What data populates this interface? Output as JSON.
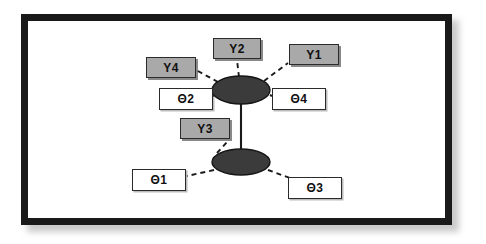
{
  "figure": {
    "type": "path-diagram",
    "frame": {
      "border_color": "#1a1a1a",
      "border_width_px": 7,
      "background": "#ffffff"
    },
    "colors": {
      "indicator_fill": "#a9a9a9",
      "error_fill": "#ffffff",
      "node_fill": "#3b3b3b",
      "stroke": "#2b2b2b",
      "line": "#1a1a1a"
    }
  },
  "latent_nodes": [
    {
      "id": "factor-top",
      "label": "",
      "cx": 241,
      "cy": 90,
      "rx": 29,
      "ry": 14
    },
    {
      "id": "factor-bottom",
      "label": "",
      "cx": 241,
      "cy": 162,
      "rx": 29,
      "ry": 13
    }
  ],
  "indicator_boxes": [
    {
      "id": "y1",
      "label": "Y1",
      "style": "gray",
      "x": 289,
      "y": 44,
      "w": 50,
      "h": 21
    },
    {
      "id": "y2",
      "label": "Y2",
      "style": "gray",
      "x": 213,
      "y": 38,
      "w": 48,
      "h": 21
    },
    {
      "id": "y3",
      "label": "Y3",
      "style": "gray",
      "x": 180,
      "y": 118,
      "w": 50,
      "h": 21
    },
    {
      "id": "y4",
      "label": "Y4",
      "style": "gray",
      "x": 146,
      "y": 57,
      "w": 50,
      "h": 21
    }
  ],
  "error_boxes": [
    {
      "id": "t1",
      "label": "Θ1",
      "style": "white",
      "x": 132,
      "y": 169,
      "w": 54,
      "h": 22
    },
    {
      "id": "t2",
      "label": "Θ2",
      "style": "white",
      "x": 159,
      "y": 88,
      "w": 54,
      "h": 22
    },
    {
      "id": "t3",
      "label": "Θ3",
      "style": "white",
      "x": 288,
      "y": 177,
      "w": 54,
      "h": 22
    },
    {
      "id": "t4",
      "label": "Θ4",
      "style": "white",
      "x": 272,
      "y": 88,
      "w": 54,
      "h": 22
    }
  ],
  "edges": [
    {
      "id": "edge-factor-link",
      "from": "factor-top",
      "to": "factor-bottom",
      "style": "solid"
    },
    {
      "id": "edge-top-y4",
      "from": "factor-top",
      "to": "y4",
      "style": "dashed"
    },
    {
      "id": "edge-top-y2",
      "from": "factor-top",
      "to": "y2",
      "style": "dashed"
    },
    {
      "id": "edge-top-y1",
      "from": "factor-top",
      "to": "y1",
      "style": "dashed"
    },
    {
      "id": "edge-top-t2",
      "from": "factor-top",
      "to": "t2",
      "style": "solid"
    },
    {
      "id": "edge-top-t4",
      "from": "factor-top",
      "to": "t4",
      "style": "solid"
    },
    {
      "id": "edge-bottom-y3",
      "from": "factor-bottom",
      "to": "y3",
      "style": "dashed"
    },
    {
      "id": "edge-bottom-t1",
      "from": "factor-bottom",
      "to": "t1",
      "style": "dashed"
    },
    {
      "id": "edge-bottom-t3",
      "from": "factor-bottom",
      "to": "t3",
      "style": "dashed"
    }
  ]
}
